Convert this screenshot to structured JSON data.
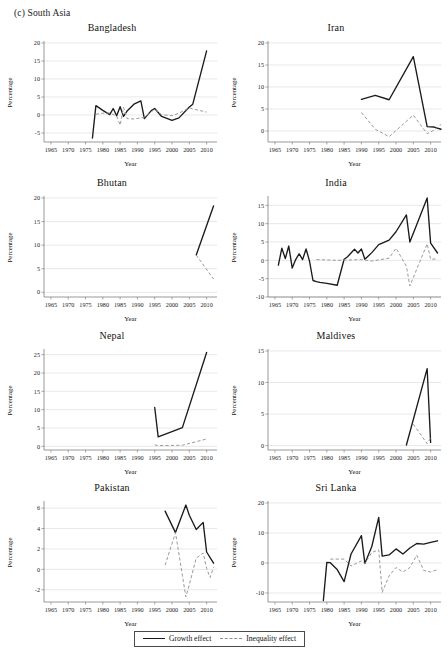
{
  "figure": {
    "section_label": "(c) South Asia",
    "axis_x_title": "Year",
    "axis_y_title": "Percentage"
  },
  "legend": {
    "growth_label": "Growth effect",
    "inequality_label": "Inequality effect",
    "growth_color": "#1b1b1b",
    "inequality_color": "#9a9a9a"
  },
  "chart_data": [
    {
      "type": "line",
      "title": "Bangladesh",
      "xlabel": "Year",
      "ylabel": "Percentage",
      "xlim": [
        1963,
        2013
      ],
      "ylim": [
        -7.5,
        20
      ],
      "xticks": [
        1965,
        1970,
        1975,
        1980,
        1985,
        1990,
        1995,
        2000,
        2005,
        2010
      ],
      "yticks": [
        -5,
        0,
        5,
        10,
        15,
        20
      ],
      "grid": true,
      "legend_position": "figure-bottom",
      "series": [
        {
          "name": "Growth effect",
          "x": [
            1977,
            1978,
            1980,
            1982,
            1983,
            1984,
            1985,
            1986,
            1987,
            1989,
            1991,
            1992,
            1994,
            1995,
            1997,
            2000,
            2002,
            2005,
            2006,
            2010
          ],
          "values": [
            -6.4,
            2.6,
            1.3,
            0.1,
            1.8,
            -0.2,
            2.3,
            -0.4,
            1.1,
            3.0,
            3.9,
            -1.0,
            1.2,
            1.8,
            -0.4,
            -1.5,
            -0.8,
            2.2,
            3.0,
            17.8
          ]
        },
        {
          "name": "Inequality effect",
          "x": [
            1978,
            1980,
            1982,
            1984,
            1985,
            1986,
            1987,
            1989,
            1991,
            1992,
            1994,
            1995,
            1997,
            2000,
            2002,
            2005,
            2006,
            2010
          ],
          "values": [
            0.2,
            0.5,
            0.6,
            -0.3,
            -2.8,
            2.1,
            -1.0,
            -1.1,
            -0.8,
            -0.6,
            0.9,
            1.5,
            0.1,
            -0.2,
            0.5,
            2.0,
            1.7,
            0.8
          ]
        }
      ]
    },
    {
      "type": "line",
      "title": "Iran",
      "xlabel": "Year",
      "ylabel": "Percentage",
      "xlim": [
        1963,
        2013
      ],
      "ylim": [
        -2.5,
        20
      ],
      "xticks": [
        1965,
        1970,
        1975,
        1980,
        1985,
        1990,
        1995,
        2000,
        2005,
        2010
      ],
      "yticks": [
        0,
        5,
        10,
        15,
        20
      ],
      "grid": true,
      "legend_position": "figure-bottom",
      "series": [
        {
          "name": "Growth effect",
          "x": [
            1990,
            1994,
            1998,
            2005,
            2009,
            2011,
            2013
          ],
          "values": [
            7.2,
            8.1,
            7.1,
            16.9,
            1.0,
            0.9,
            0.4
          ]
        },
        {
          "name": "Inequality effect",
          "x": [
            1990,
            1994,
            1998,
            2005,
            2009,
            2011,
            2013
          ],
          "values": [
            4.2,
            0.4,
            -1.3,
            3.6,
            -0.6,
            0.2,
            1.5
          ]
        }
      ]
    },
    {
      "type": "line",
      "title": "Bhutan",
      "xlabel": "Year",
      "ylabel": "Percentage",
      "xlim": [
        1963,
        2013
      ],
      "ylim": [
        -1,
        20
      ],
      "xticks": [
        1965,
        1970,
        1975,
        1980,
        1985,
        1990,
        1995,
        2000,
        2005,
        2010
      ],
      "yticks": [
        0,
        5,
        10,
        15,
        20
      ],
      "grid": true,
      "legend_position": "figure-bottom",
      "series": [
        {
          "name": "Growth effect",
          "x": [
            2007,
            2012
          ],
          "values": [
            7.9,
            18.3
          ]
        },
        {
          "name": "Inequality effect",
          "x": [
            2007,
            2012
          ],
          "values": [
            7.9,
            2.8
          ]
        }
      ]
    },
    {
      "type": "line",
      "title": "India",
      "xlabel": "Year",
      "ylabel": "Percentage",
      "xlim": [
        1963,
        2013
      ],
      "ylim": [
        -10,
        17
      ],
      "xticks": [
        1965,
        1970,
        1975,
        1980,
        1985,
        1990,
        1995,
        2000,
        2005,
        2010
      ],
      "yticks": [
        -10,
        -5,
        0,
        5,
        10,
        15
      ],
      "grid": true,
      "legend_position": "figure-bottom",
      "series": [
        {
          "name": "Growth effect",
          "x": [
            1966,
            1967,
            1968,
            1969,
            1970,
            1971,
            1972,
            1973,
            1974,
            1975,
            1976,
            1977,
            1978,
            1980,
            1983,
            1985,
            1986,
            1987,
            1988,
            1989,
            1990,
            1991,
            1993,
            1995,
            1998,
            2000,
            2003,
            2004,
            2006,
            2009,
            2010,
            2012
          ],
          "values": [
            -1.3,
            3.3,
            0.5,
            3.9,
            -2.1,
            0.2,
            1.8,
            0.2,
            3.1,
            -0.2,
            -5.5,
            -5.8,
            -6.0,
            -6.3,
            -6.8,
            0.3,
            1.0,
            2.0,
            3.0,
            2.0,
            3.1,
            0.3,
            2.1,
            4.3,
            5.5,
            7.8,
            12.4,
            5.0,
            9.8,
            17.0,
            4.7,
            2.0
          ]
        },
        {
          "name": "Inequality effect",
          "x": [
            1977,
            1983,
            1987,
            1990,
            1993,
            1995,
            1998,
            2000,
            2003,
            2004,
            2009,
            2010,
            2012
          ],
          "values": [
            0.2,
            0.0,
            0.1,
            0.2,
            -0.2,
            0.1,
            0.6,
            3.3,
            -1.6,
            -7.0,
            4.5,
            0.3,
            0.4
          ]
        }
      ]
    },
    {
      "type": "line",
      "title": "Nepal",
      "xlabel": "Year",
      "ylabel": "Percentage",
      "xlim": [
        1963,
        2013
      ],
      "ylim": [
        -1,
        26
      ],
      "xticks": [
        1965,
        1970,
        1975,
        1980,
        1985,
        1990,
        1995,
        2000,
        2005,
        2010
      ],
      "yticks": [
        0,
        5,
        10,
        15,
        20,
        25
      ],
      "grid": true,
      "legend_position": "figure-bottom",
      "series": [
        {
          "name": "Growth effect",
          "x": [
            1995,
            1996,
            2003,
            2010
          ],
          "values": [
            10.6,
            2.6,
            5.1,
            25.6
          ]
        },
        {
          "name": "Inequality effect",
          "x": [
            1995,
            1996,
            2003,
            2010
          ],
          "values": [
            0.4,
            0.2,
            0.3,
            2.0
          ]
        }
      ]
    },
    {
      "type": "line",
      "title": "Maldives",
      "xlabel": "Year",
      "ylabel": "Percentage",
      "xlim": [
        1963,
        2013
      ],
      "ylim": [
        -0.7,
        15
      ],
      "xticks": [
        1965,
        1970,
        1975,
        1980,
        1985,
        1990,
        1995,
        2000,
        2005,
        2010
      ],
      "yticks": [
        0,
        5,
        10,
        15
      ],
      "grid": true,
      "legend_position": "figure-bottom",
      "series": [
        {
          "name": "Growth effect",
          "x": [
            2003,
            2009,
            2010
          ],
          "values": [
            0.1,
            12.2,
            0.5
          ]
        },
        {
          "name": "Inequality effect",
          "x": [
            2005,
            2009,
            2010
          ],
          "values": [
            3.4,
            0.3,
            1.2
          ]
        }
      ]
    },
    {
      "type": "line",
      "title": "Pakistan",
      "xlabel": "Year",
      "ylabel": "Percentage",
      "xlim": [
        1963,
        2013
      ],
      "ylim": [
        -3.2,
        6.5
      ],
      "xticks": [
        1965,
        1970,
        1975,
        1980,
        1985,
        1990,
        1995,
        2000,
        2005,
        2010
      ],
      "yticks": [
        -2,
        0,
        2,
        4,
        6
      ],
      "grid": true,
      "legend_position": "figure-bottom",
      "series": [
        {
          "name": "Growth effect",
          "x": [
            1998,
            2001,
            2004,
            2005,
            2007,
            2009,
            2010,
            2012
          ],
          "values": [
            5.7,
            3.6,
            6.3,
            5.3,
            3.9,
            4.6,
            1.7,
            0.6
          ]
        },
        {
          "name": "Inequality effect",
          "x": [
            1998,
            2001,
            2004,
            2005,
            2007,
            2009,
            2010,
            2011,
            2012
          ],
          "values": [
            0.4,
            3.6,
            -2.7,
            -1.5,
            1.1,
            1.6,
            0.1,
            -0.8,
            0.2
          ]
        }
      ]
    },
    {
      "type": "line",
      "title": "Sri Lanka",
      "xlabel": "Year",
      "ylabel": "Percentage",
      "xlim": [
        1963,
        2013
      ],
      "ylim": [
        -13,
        20
      ],
      "xticks": [
        1965,
        1970,
        1975,
        1980,
        1985,
        1990,
        1995,
        2000,
        2005,
        2010
      ],
      "yticks": [
        -10,
        0,
        10,
        20
      ],
      "grid": true,
      "legend_position": "figure-bottom",
      "series": [
        {
          "name": "Growth effect",
          "x": [
            1979,
            1980,
            1981,
            1983,
            1985,
            1987,
            1990,
            1991,
            1993,
            1995,
            1996,
            1998,
            2000,
            2002,
            2004,
            2006,
            2008,
            2010,
            2012
          ],
          "values": [
            -12.5,
            0.2,
            0.1,
            -2.2,
            -6.2,
            3.0,
            9.1,
            -0.2,
            5.5,
            15.2,
            2.3,
            2.7,
            4.7,
            3.0,
            5.0,
            6.5,
            6.3,
            6.9,
            7.4
          ]
        },
        {
          "name": "Inequality effect",
          "x": [
            1981,
            1983,
            1985,
            1987,
            1990,
            1991,
            1993,
            1995,
            1996,
            1998,
            2000,
            2002,
            2004,
            2006,
            2008,
            2010,
            2012
          ],
          "values": [
            1.3,
            1.3,
            1.3,
            -1.0,
            0.7,
            -0.2,
            3.5,
            4.4,
            -9.8,
            -4.3,
            -1.5,
            -3.0,
            -1.5,
            2.6,
            -2.5,
            -3.0,
            -2.2
          ]
        }
      ]
    }
  ]
}
